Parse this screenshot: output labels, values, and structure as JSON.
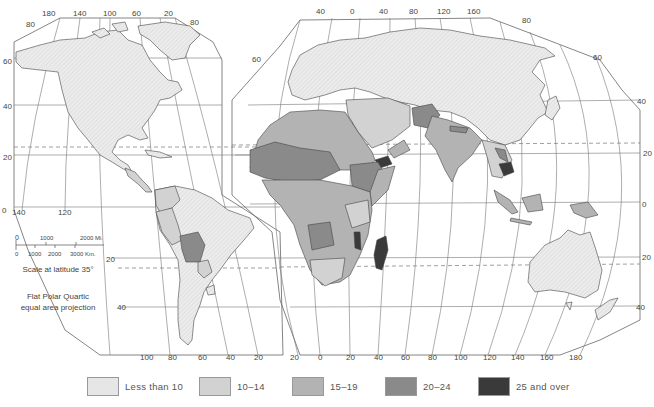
{
  "map": {
    "type": "choropleth",
    "projection_note": [
      "Flat Polar Quartic",
      "equal area projection"
    ],
    "scale": {
      "miles_ticks": [
        "0",
        "1000",
        "2000 Mi."
      ],
      "km_ticks": [
        "0",
        "1000",
        "2000",
        "3000 Km."
      ],
      "caption": "Scale at latitude 35°"
    },
    "graticule_labels": {
      "left_top_lon": [
        "180",
        "140",
        "100",
        "60",
        "20"
      ],
      "left_lat": [
        "80",
        "60",
        "40",
        "20",
        "0"
      ],
      "left_top_right_lat": "80",
      "left_mid_lon": [
        "140",
        "120"
      ],
      "left_bottom_lon": [
        "100",
        "80",
        "60",
        "40",
        "20"
      ],
      "left_sa_lat": [
        "20",
        "40"
      ],
      "right_top_lon": [
        "40",
        "0",
        "40",
        "80",
        "120",
        "160"
      ],
      "right_top_lat": [
        "80",
        "60"
      ],
      "right_left_lat": "60",
      "right_lat": [
        "40",
        "20",
        "0",
        "20",
        "40"
      ],
      "right_bottom_lon": [
        "20",
        "0",
        "20",
        "40",
        "60",
        "80",
        "100",
        "120",
        "140",
        "160",
        "180"
      ]
    },
    "colors": {
      "less_than_10": "#e6e6e6",
      "10_14": "#d2d2d2",
      "15_19": "#b3b3b3",
      "20_24": "#8a8a8a",
      "25_and_over": "#3a3a3a",
      "no_data": "#ffffff"
    }
  },
  "legend": {
    "items": [
      {
        "label": "Less than 10",
        "color": "#e6e6e6"
      },
      {
        "label": "10–14",
        "color": "#d2d2d2"
      },
      {
        "label": "15–19",
        "color": "#b3b3b3"
      },
      {
        "label": "20–24",
        "color": "#8a8a8a"
      },
      {
        "label": "25 and over",
        "color": "#3a3a3a"
      }
    ]
  }
}
